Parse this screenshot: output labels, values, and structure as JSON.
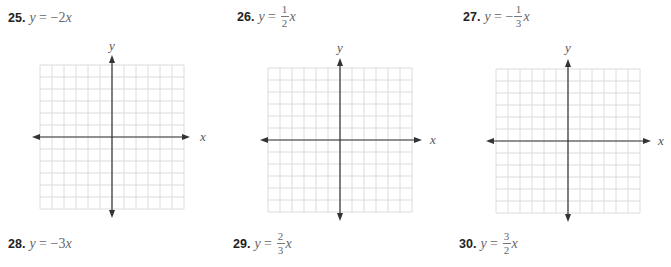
{
  "problems": [
    {
      "number": "25.",
      "lhs": "y",
      "eq": "=",
      "rhs_prefix": "−2",
      "var": "x",
      "fraction": null
    },
    {
      "number": "26.",
      "lhs": "y",
      "eq": "=",
      "rhs_prefix": "",
      "var": "x",
      "fraction": {
        "num": "1",
        "den": "2"
      }
    },
    {
      "number": "27.",
      "lhs": "y",
      "eq": "=",
      "rhs_prefix": "−",
      "var": "x",
      "fraction": {
        "num": "1",
        "den": "3"
      }
    },
    {
      "number": "28.",
      "lhs": "y",
      "eq": "=",
      "rhs_prefix": "−3",
      "var": "x",
      "fraction": null
    },
    {
      "number": "29.",
      "lhs": "y",
      "eq": "=",
      "rhs_prefix": "",
      "var": "x",
      "fraction": {
        "num": "2",
        "den": "3"
      }
    },
    {
      "number": "30.",
      "lhs": "y",
      "eq": "=",
      "rhs_prefix": "",
      "var": "x",
      "fraction": {
        "num": "3",
        "den": "2"
      }
    }
  ],
  "graphs": [
    {
      "x_label": "x",
      "y_label": "y",
      "grid_cells": 12
    },
    {
      "x_label": "x",
      "y_label": "y",
      "grid_cells": 12
    },
    {
      "x_label": "x",
      "y_label": "y",
      "grid_cells": 12
    }
  ],
  "colors": {
    "grid": "#dcdcdc",
    "axis": "#333333"
  }
}
